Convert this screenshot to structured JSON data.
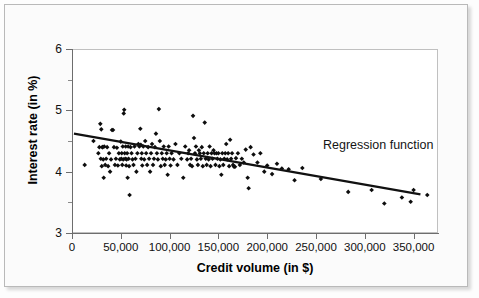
{
  "chart_data": {
    "type": "scatter",
    "title": "",
    "xlabel": "Credit volume (in $)",
    "ylabel": "Interest rate (in %)",
    "xlim": [
      0,
      375000
    ],
    "ylim": [
      3,
      6
    ],
    "grid": false,
    "legend_position": "none",
    "annotations": [
      {
        "text": "Regression function",
        "x": 255000,
        "y": 4.25
      }
    ],
    "xticks": [
      0,
      50000,
      100000,
      150000,
      200000,
      250000,
      300000,
      350000
    ],
    "xticklabels": [
      "0",
      "50,000",
      "100,000",
      "150,000",
      "200,000",
      "250,000",
      "300,000",
      "350,000"
    ],
    "yticks": [
      3,
      4,
      5,
      6
    ],
    "yticklabels": [
      "3",
      "4",
      "5",
      "6"
    ],
    "yticks_minor": [
      3.5,
      4.5,
      5.5
    ],
    "marker": "diamond",
    "marker_color": "#0d0d0d",
    "series": [
      {
        "name": "Credit observations",
        "points": [
          [
            13000,
            4.11
          ],
          [
            22000,
            4.5
          ],
          [
            27000,
            4.3
          ],
          [
            28000,
            4.4
          ],
          [
            29000,
            4.78
          ],
          [
            29500,
            4.21
          ],
          [
            30000,
            4.69
          ],
          [
            30500,
            4.09
          ],
          [
            31000,
            4.4
          ],
          [
            31500,
            4.4
          ],
          [
            32000,
            4.2
          ],
          [
            32500,
            3.9
          ],
          [
            33000,
            4.41
          ],
          [
            34000,
            4.11
          ],
          [
            35000,
            4.21
          ],
          [
            36000,
            4.4
          ],
          [
            37000,
            4.09
          ],
          [
            38000,
            4.3
          ],
          [
            39000,
            4.0
          ],
          [
            40000,
            4.2
          ],
          [
            41000,
            4.68
          ],
          [
            42000,
            4.68
          ],
          [
            43000,
            4.4
          ],
          [
            44000,
            4.11
          ],
          [
            45000,
            4.21
          ],
          [
            46000,
            4.39
          ],
          [
            47000,
            4.1
          ],
          [
            48000,
            4.3
          ],
          [
            49000,
            4.2
          ],
          [
            50000,
            4.49
          ],
          [
            50500,
            4.21
          ],
          [
            51000,
            4.3
          ],
          [
            51500,
            4.11
          ],
          [
            52000,
            4.41
          ],
          [
            52500,
            4.2
          ],
          [
            53000,
            4.95
          ],
          [
            53500,
            5.01
          ],
          [
            54000,
            4.3
          ],
          [
            54500,
            4.21
          ],
          [
            55000,
            4.41
          ],
          [
            55500,
            4.1
          ],
          [
            56000,
            4.2
          ],
          [
            56500,
            4.3
          ],
          [
            57000,
            3.9
          ],
          [
            57500,
            4.41
          ],
          [
            58000,
            4.21
          ],
          [
            58500,
            4.09
          ],
          [
            59000,
            3.62
          ],
          [
            60000,
            4.4
          ],
          [
            61000,
            4.3
          ],
          [
            62000,
            4.2
          ],
          [
            63000,
            4.11
          ],
          [
            64000,
            4.41
          ],
          [
            65000,
            4.21
          ],
          [
            66000,
            4.0
          ],
          [
            67000,
            4.3
          ],
          [
            68000,
            4.45
          ],
          [
            69000,
            4.41
          ],
          [
            70000,
            4.7
          ],
          [
            70500,
            4.44
          ],
          [
            71000,
            4.21
          ],
          [
            71500,
            4.3
          ],
          [
            72000,
            4.1
          ],
          [
            73000,
            4.41
          ],
          [
            74000,
            4.2
          ],
          [
            75000,
            4.5
          ],
          [
            76000,
            4.3
          ],
          [
            77000,
            4.11
          ],
          [
            78000,
            4.4
          ],
          [
            79000,
            4.21
          ],
          [
            80000,
            4.0
          ],
          [
            81000,
            4.3
          ],
          [
            82000,
            4.45
          ],
          [
            83000,
            4.11
          ],
          [
            84000,
            4.21
          ],
          [
            85000,
            4.4
          ],
          [
            86000,
            4.62
          ],
          [
            87000,
            4.3
          ],
          [
            88000,
            4.2
          ],
          [
            89000,
            5.02
          ],
          [
            90000,
            4.5
          ],
          [
            91000,
            4.09
          ],
          [
            92000,
            4.3
          ],
          [
            93000,
            4.21
          ],
          [
            94000,
            4.41
          ],
          [
            95000,
            4.11
          ],
          [
            96000,
            4.2
          ],
          [
            97000,
            4.3
          ],
          [
            98000,
            3.95
          ],
          [
            99000,
            4.41
          ],
          [
            100000,
            4.21
          ],
          [
            101000,
            4.1
          ],
          [
            102000,
            4.3
          ],
          [
            104000,
            4.2
          ],
          [
            106000,
            4.45
          ],
          [
            108000,
            4.11
          ],
          [
            110000,
            4.3
          ],
          [
            112000,
            4.21
          ],
          [
            114000,
            3.9
          ],
          [
            116000,
            4.41
          ],
          [
            118000,
            4.2
          ],
          [
            119000,
            4.3
          ],
          [
            120000,
            4.35
          ],
          [
            121000,
            4.11
          ],
          [
            122000,
            4.21
          ],
          [
            123000,
            4.09
          ],
          [
            124000,
            4.91
          ],
          [
            125000,
            4.55
          ],
          [
            126000,
            4.3
          ],
          [
            127000,
            4.41
          ],
          [
            128000,
            4.2
          ],
          [
            129000,
            4.11
          ],
          [
            130000,
            4.35
          ],
          [
            131000,
            4.3
          ],
          [
            132000,
            4.21
          ],
          [
            133000,
            4.4
          ],
          [
            134000,
            4.09
          ],
          [
            135000,
            4.3
          ],
          [
            136000,
            4.8
          ],
          [
            137000,
            4.21
          ],
          [
            138000,
            4.11
          ],
          [
            139000,
            4.3
          ],
          [
            140000,
            4.2
          ],
          [
            141000,
            4.41
          ],
          [
            142000,
            4.09
          ],
          [
            143000,
            4.3
          ],
          [
            144000,
            4.21
          ],
          [
            145000,
            4.35
          ],
          [
            146000,
            4.3
          ],
          [
            147000,
            4.11
          ],
          [
            148000,
            4.3
          ],
          [
            149000,
            4.21
          ],
          [
            150000,
            4.3
          ],
          [
            151000,
            4.09
          ],
          [
            152000,
            4.2
          ],
          [
            153000,
            3.95
          ],
          [
            154000,
            4.3
          ],
          [
            155000,
            4.11
          ],
          [
            156000,
            4.21
          ],
          [
            157000,
            4.3
          ],
          [
            158000,
            4.45
          ],
          [
            159000,
            4.2
          ],
          [
            160000,
            4.3
          ],
          [
            161000,
            4.09
          ],
          [
            162000,
            4.52
          ],
          [
            163000,
            4.21
          ],
          [
            164000,
            4.3
          ],
          [
            165000,
            4.11
          ],
          [
            166000,
            4.08
          ],
          [
            167000,
            4.08
          ],
          [
            168000,
            4.22
          ],
          [
            170000,
            4.3
          ],
          [
            172000,
            4.11
          ],
          [
            174000,
            4.21
          ],
          [
            176000,
            4.15
          ],
          [
            178000,
            4.36
          ],
          [
            180000,
            3.9
          ],
          [
            181000,
            3.73
          ],
          [
            183000,
            4.4
          ],
          [
            186000,
            4.28
          ],
          [
            190000,
            4.15
          ],
          [
            193000,
            4.3
          ],
          [
            197000,
            4.0
          ],
          [
            200000,
            4.1
          ],
          [
            205000,
            3.96
          ],
          [
            210000,
            4.13
          ],
          [
            215000,
            4.05
          ],
          [
            222000,
            4.04
          ],
          [
            228000,
            3.86
          ],
          [
            236000,
            4.06
          ],
          [
            255000,
            3.88
          ],
          [
            283000,
            3.67
          ],
          [
            307000,
            3.7
          ],
          [
            320000,
            3.48
          ],
          [
            338000,
            3.58
          ],
          [
            347000,
            3.51
          ],
          [
            350000,
            3.7
          ],
          [
            364000,
            3.62
          ]
        ]
      }
    ],
    "regression_line": {
      "label": "Regression function",
      "x_start": 2000,
      "y_start": 4.62,
      "x_end": 357000,
      "y_end": 3.63,
      "color": "#111111",
      "width": 2.2
    }
  }
}
